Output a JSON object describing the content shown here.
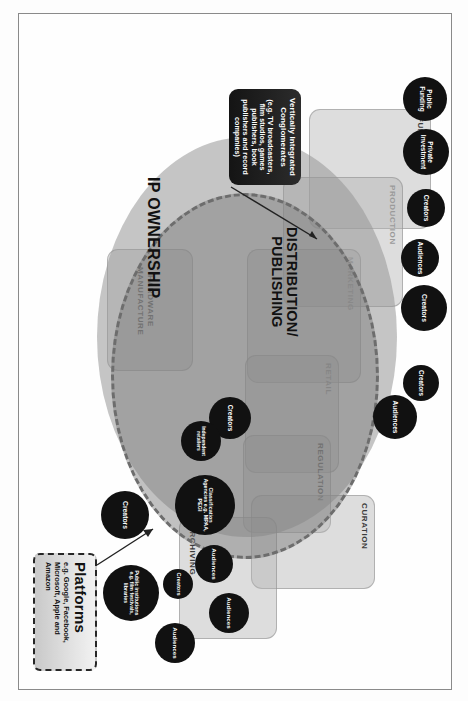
{
  "diagram": {
    "frame_color": "#8a8a8a",
    "node_color": "#111111",
    "chain_color": "#b0b0b0",
    "ellipse_ip_color": "#969696",
    "ellipse_dist_color": "#787878"
  },
  "ellipses": [
    {
      "id": "ip",
      "label": "IP OWNERSHIP"
    },
    {
      "id": "distribution",
      "label_line1": "DISTRIBUTION/",
      "label_line2": "PUBLISHING"
    }
  ],
  "chain_stages": [
    {
      "key": "funding",
      "label": "FUNDING"
    },
    {
      "key": "production",
      "label": "PRODUCTION"
    },
    {
      "key": "marketing",
      "label": "MARKETING"
    },
    {
      "key": "retail",
      "label": "RETAIL"
    },
    {
      "key": "regulation",
      "label": "REGULATION"
    },
    {
      "key": "curation",
      "label": "CURATION"
    },
    {
      "key": "archiving",
      "label": "ARCHIVING"
    },
    {
      "key": "hardware",
      "label_line1": "HARDWARE",
      "label_line2": "MANUFACTURE"
    }
  ],
  "stakeholders": [
    {
      "key": "public-funding",
      "label": "Public Funding"
    },
    {
      "key": "private-investment",
      "label": "Private Investment"
    },
    {
      "key": "creators-production",
      "label": "Creators"
    },
    {
      "key": "audiences-production",
      "label": "Audiences"
    },
    {
      "key": "creators-marketing",
      "label": "Creators"
    },
    {
      "key": "creators-marketing-2",
      "label": "Creators"
    },
    {
      "key": "audiences-marketing",
      "label": "Audiences"
    },
    {
      "key": "creators-retail",
      "label": "Creators"
    },
    {
      "key": "independent-retailers",
      "label": "Independent retailers"
    },
    {
      "key": "classification",
      "label": "Classification Agencies e.g. MPAA, PEGI"
    },
    {
      "key": "audiences-regulation",
      "label": "Audiences"
    },
    {
      "key": "audiences-curation",
      "label": "Audiences"
    },
    {
      "key": "audiences-archiving",
      "label": "Audiences"
    },
    {
      "key": "public-institutions",
      "label": "Public institutions e.g. film festivals, libraries"
    },
    {
      "key": "creators-archiving",
      "label": "Creators"
    },
    {
      "key": "creators-hardware",
      "label": "Creators"
    }
  ],
  "callouts": [
    {
      "key": "vertically-integrated-conglomerates",
      "title": "Vertically  Integrated Conglomerates",
      "body": "(e.g. TV broadcasters, film studios, games publishers, book publishers and record companies)"
    },
    {
      "key": "platforms",
      "title": "Platforms",
      "body": "e.g. Google, Facebook, Microsoft, Apple and Amazon"
    }
  ]
}
